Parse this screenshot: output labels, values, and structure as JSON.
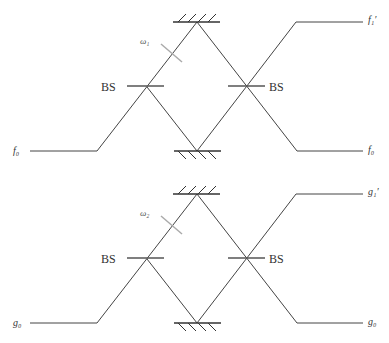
{
  "diagrams": [
    {
      "name": "interferometer-f",
      "input_label": "f₀",
      "output_upper_label": "f₁′",
      "output_lower_label": "f₀",
      "phase_label": "ω₁",
      "beam_splitter_left_label": "BS",
      "beam_splitter_right_label": "BS"
    },
    {
      "name": "interferometer-g",
      "input_label": "g₀",
      "output_upper_label": "g₁′",
      "output_lower_label": "g₀",
      "phase_label": "ω₂",
      "beam_splitter_left_label": "BS",
      "beam_splitter_right_label": "BS"
    }
  ],
  "colors": {
    "beam": "#444444",
    "phase_plate": "#aaaaaa",
    "splitter": "#555555"
  }
}
